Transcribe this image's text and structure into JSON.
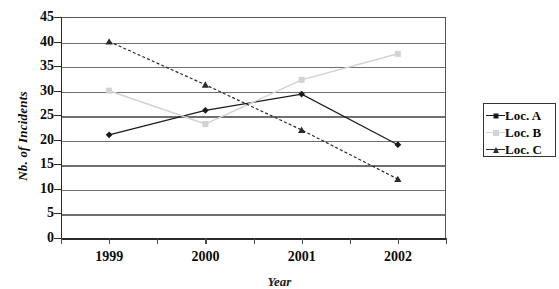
{
  "chart_data": {
    "type": "line",
    "title": "",
    "xlabel": "Year",
    "ylabel": "Nb. of Incidents",
    "categories": [
      "1999",
      "2000",
      "2001",
      "2002"
    ],
    "ylim": [
      0,
      45
    ],
    "ytick_values": [
      0,
      5,
      10,
      15,
      20,
      25,
      30,
      35,
      40,
      45
    ],
    "ytick_labels": [
      "0",
      "5",
      "10",
      "15",
      "20",
      "25",
      "30",
      "35",
      "40",
      "45"
    ],
    "grid": true,
    "legend_position": "right",
    "series": [
      {
        "name": "Loc. A",
        "values": [
          21,
          26,
          29.3,
          19
        ],
        "color": "#1a1a1a",
        "marker": "diamond"
      },
      {
        "name": "Loc. B",
        "values": [
          30,
          23.2,
          32.2,
          37.5
        ],
        "color": "#d2d2d2",
        "marker": "square"
      },
      {
        "name": "Loc. C",
        "values": [
          40,
          31.2,
          22,
          12
        ],
        "color": "#2b2b2b",
        "marker": "triangle"
      }
    ]
  },
  "legend": {
    "items": [
      {
        "label": "Loc. A"
      },
      {
        "label": "Loc. B"
      },
      {
        "label": "Loc. C"
      }
    ]
  }
}
